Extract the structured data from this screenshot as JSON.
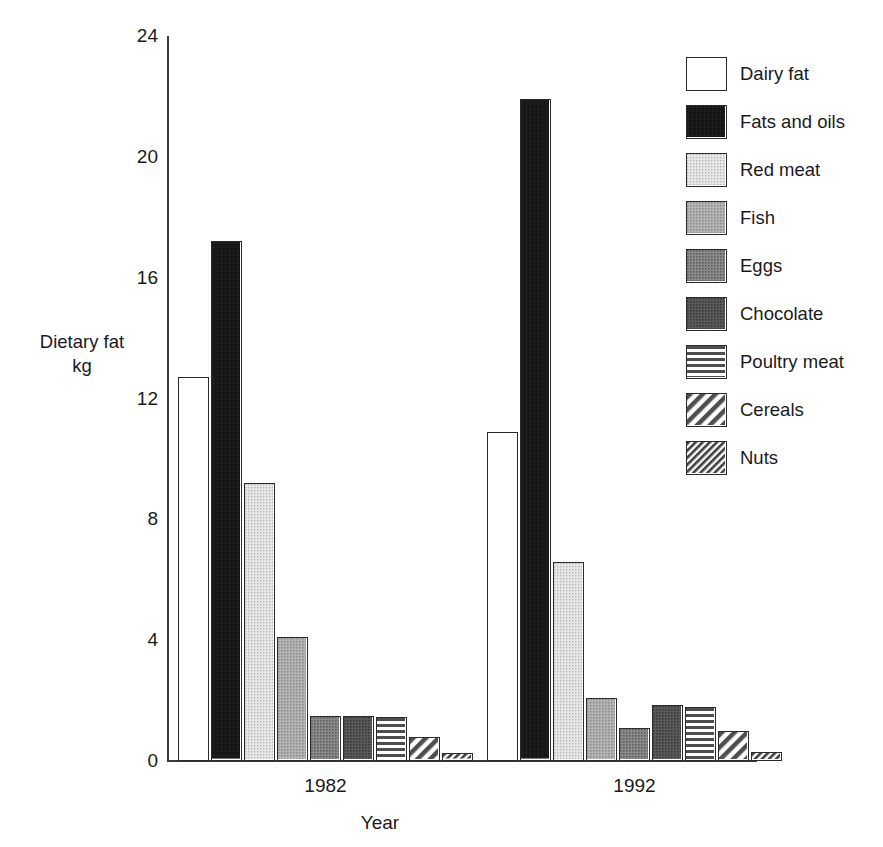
{
  "chart_data": {
    "type": "bar",
    "title": "",
    "xlabel": "Year",
    "ylabel": "Dietary fat\nkg",
    "ylabel_line1": "Dietary fat",
    "ylabel_line2": "kg",
    "categories": [
      "1982",
      "1992"
    ],
    "ylim": [
      0,
      24
    ],
    "yticks": [
      0,
      4,
      8,
      12,
      16,
      20,
      24
    ],
    "ytick_labels": [
      "0",
      "4",
      "8",
      "12",
      "16",
      "20",
      "24"
    ],
    "grid": false,
    "legend_position": "right",
    "series": [
      {
        "name": "Dairy fat",
        "values": [
          12.7,
          10.9
        ],
        "fill": "solid-white",
        "color": "#ffffff"
      },
      {
        "name": "Fats and oils",
        "values": [
          17.2,
          21.9
        ],
        "fill": "solid-black",
        "color": "#1c1c1c"
      },
      {
        "name": "Red meat",
        "values": [
          9.2,
          6.6
        ],
        "fill": "solid-light",
        "color": "#d4d4d4"
      },
      {
        "name": "Fish",
        "values": [
          4.1,
          2.1
        ],
        "fill": "solid-mid",
        "color": "#9a9a9a"
      },
      {
        "name": "Eggs",
        "values": [
          1.5,
          1.1
        ],
        "fill": "solid-dark",
        "color": "#707070"
      },
      {
        "name": "Chocolate",
        "values": [
          1.5,
          1.85
        ],
        "fill": "solid-darker",
        "color": "#4a4a4a"
      },
      {
        "name": "Poultry meat",
        "values": [
          1.45,
          1.8
        ],
        "fill": "horizontal",
        "color": "#555555"
      },
      {
        "name": "Cereals",
        "values": [
          0.8,
          1.0
        ],
        "fill": "diagonal-wide",
        "color": "#555555"
      },
      {
        "name": "Nuts",
        "values": [
          0.25,
          0.3
        ],
        "fill": "diagonal-dense",
        "color": "#444444"
      }
    ]
  },
  "axes": {
    "y_title_line1": "Dietary fat",
    "y_title_line2": "kg",
    "x_title": "Year"
  }
}
